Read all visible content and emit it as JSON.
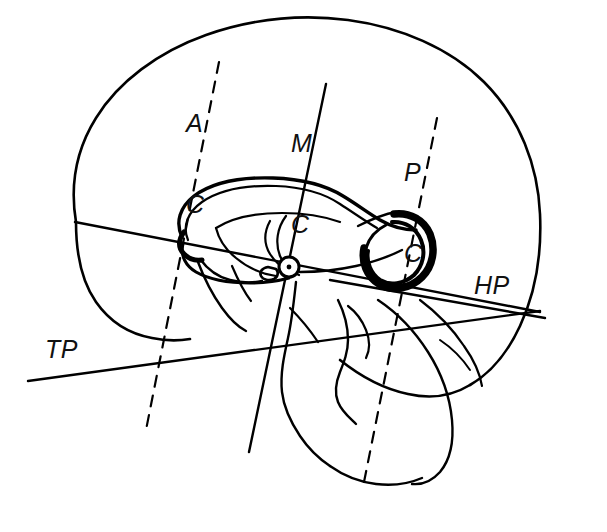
{
  "figure": {
    "type": "anatomical-line-drawing",
    "background_color": "#ffffff",
    "ink_color": "#000000",
    "width": 607,
    "height": 532
  },
  "labels": {
    "ac": {
      "line1": "A",
      "line2": "C",
      "full": "AC",
      "line_style": "dashed"
    },
    "mc": {
      "line1": "M",
      "line2": "C",
      "full": "MC",
      "line_style": "solid"
    },
    "pc": {
      "line1": "P",
      "line2": "C",
      "full": "PC",
      "line_style": "dashed"
    },
    "hp": {
      "full": "HP",
      "line_style": "solid"
    },
    "tp": {
      "full": "TP",
      "line_style": "solid"
    }
  },
  "structures": {
    "brain_outline": "cerebral hemisphere midsagittal contour",
    "corpus_callosum": "corpus callosum with genu, body and splenium",
    "splenium": "thickened posterior splenium",
    "brainstem": "brainstem and cerebellum contours",
    "midpoint_marker": "AC-PC midpoint circle marker"
  }
}
